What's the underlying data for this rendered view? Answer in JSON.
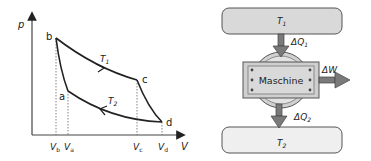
{
  "pv_diagram": {
    "y_axis_label": "p",
    "x_axis_label": "V",
    "points": {
      "a": "a",
      "b": "b",
      "c": "c",
      "d": "d"
    },
    "isotherm_hot": "T",
    "isotherm_hot_sub": "1",
    "isotherm_cold": "T",
    "isotherm_cold_sub": "2",
    "volume_ticks": [
      {
        "main": "V",
        "sub": "b"
      },
      {
        "main": "V",
        "sub": "a"
      },
      {
        "main": "V",
        "sub": "c"
      },
      {
        "main": "V",
        "sub": "d"
      }
    ]
  },
  "engine_diagram": {
    "hot_reservoir": {
      "main": "T",
      "sub": "1"
    },
    "cold_reservoir": {
      "main": "T",
      "sub": "2"
    },
    "heat_in": {
      "main": "ΔQ",
      "sub": "1"
    },
    "heat_out": {
      "main": "ΔQ",
      "sub": "2"
    },
    "work_out": "ΔW",
    "machine_label": "Maschine"
  },
  "colors": {
    "reservoir_fill": "#d9d9d9",
    "reservoir_cold_fill": "#efefef",
    "arrow_fill": "#7a7a7a",
    "machine_fill": "#cfcfcf",
    "line": "#222222"
  }
}
